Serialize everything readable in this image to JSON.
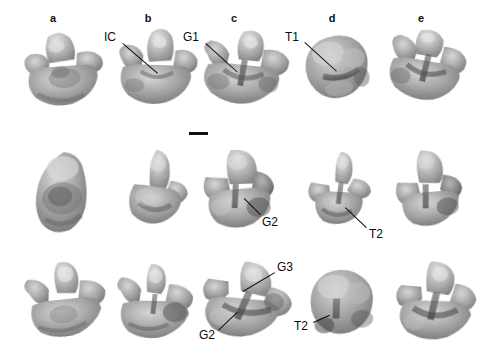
{
  "figure": {
    "background_color": "#ffffff",
    "ink_color": "#0d0d0d",
    "width": 485,
    "height": 357,
    "plate_kind": "photographic-plate",
    "specimen_count": 15,
    "row_count": 3,
    "column_count": 5
  },
  "column_headers": [
    {
      "label": "a",
      "x": 53,
      "y": 12
    },
    {
      "label": "b",
      "x": 148,
      "y": 12
    },
    {
      "label": "c",
      "x": 234,
      "y": 12
    },
    {
      "label": "d",
      "x": 332,
      "y": 12
    },
    {
      "label": "e",
      "x": 421,
      "y": 12
    }
  ],
  "scale_bar": {
    "name": "scale-bar",
    "x": 189,
    "y": 132,
    "width": 19,
    "height": 3,
    "color": "#101010"
  },
  "annotations": [
    {
      "id": "ic-row1-b",
      "text": "IC",
      "row": 1,
      "column": "b",
      "label_x": 104,
      "label_y": 31,
      "line_x1": 123,
      "line_y1": 43,
      "line_x2": 158,
      "line_y2": 73
    },
    {
      "id": "g1-row1-c",
      "text": "G1",
      "row": 1,
      "column": "c",
      "label_x": 183,
      "label_y": 31,
      "line_x1": 206,
      "line_y1": 43,
      "line_x2": 238,
      "line_y2": 72
    },
    {
      "id": "t1-row1-d",
      "text": "T1",
      "row": 1,
      "column": "d",
      "label_x": 285,
      "label_y": 31,
      "line_x1": 305,
      "line_y1": 42,
      "line_x2": 337,
      "line_y2": 71
    },
    {
      "id": "g2-row2-c",
      "text": "G2",
      "row": 2,
      "column": "c",
      "label_x": 262,
      "label_y": 216,
      "line_x1": 260,
      "line_y1": 215,
      "line_x2": 244,
      "line_y2": 199
    },
    {
      "id": "t2-row2-d",
      "text": "T2",
      "row": 2,
      "column": "d",
      "label_x": 369,
      "label_y": 228,
      "line_x1": 366,
      "line_y1": 228,
      "line_x2": 345,
      "line_y2": 208
    },
    {
      "id": "g3-row3-c",
      "text": "G3",
      "row": 3,
      "column": "c",
      "label_x": 277,
      "label_y": 261,
      "line_x1": 275,
      "line_y1": 273,
      "line_x2": 243,
      "line_y2": 292
    },
    {
      "id": "g2-row3-c",
      "text": "G2",
      "row": 3,
      "column": "c",
      "label_x": 199,
      "label_y": 329,
      "line_x1": 218,
      "line_y1": 330,
      "line_x2": 237,
      "line_y2": 312
    },
    {
      "id": "t2-row3-d",
      "text": "T2",
      "row": 3,
      "column": "d",
      "label_x": 294,
      "label_y": 320,
      "line_x1": 313,
      "line_y1": 322,
      "line_x2": 329,
      "line_y2": 315
    }
  ],
  "specimens": [
    {
      "id": "spec-a1",
      "row": 1,
      "column": "a",
      "x": 20,
      "y": 26,
      "w": 92,
      "h": 84,
      "shape": "cusped-crown-front",
      "rotate": -4
    },
    {
      "id": "spec-b1",
      "row": 1,
      "column": "b",
      "x": 113,
      "y": 24,
      "w": 88,
      "h": 86,
      "shape": "cusped-crown-front",
      "rotate": 2
    },
    {
      "id": "spec-c1",
      "row": 1,
      "column": "c",
      "x": 196,
      "y": 26,
      "w": 96,
      "h": 84,
      "shape": "cusped-crown-front",
      "rotate": 6
    },
    {
      "id": "spec-d1",
      "row": 1,
      "column": "d",
      "x": 300,
      "y": 30,
      "w": 78,
      "h": 74,
      "shape": "rounded-crown",
      "rotate": -8
    },
    {
      "id": "spec-e1",
      "row": 1,
      "column": "e",
      "x": 385,
      "y": 24,
      "w": 84,
      "h": 82,
      "shape": "cusped-crown-front",
      "rotate": 10
    },
    {
      "id": "spec-a2",
      "row": 2,
      "column": "a",
      "x": 30,
      "y": 148,
      "w": 74,
      "h": 90,
      "shape": "ovoid-lateral",
      "rotate": -3
    },
    {
      "id": "spec-b2",
      "row": 2,
      "column": "b",
      "x": 124,
      "y": 146,
      "w": 70,
      "h": 86,
      "shape": "ovoid-lateral",
      "rotate": 4
    },
    {
      "id": "spec-c2",
      "row": 2,
      "column": "c",
      "x": 198,
      "y": 146,
      "w": 80,
      "h": 86,
      "shape": "lobed-lateral",
      "rotate": -2
    },
    {
      "id": "spec-d2",
      "row": 2,
      "column": "d",
      "x": 305,
      "y": 148,
      "w": 72,
      "h": 82,
      "shape": "cusped-lateral",
      "rotate": 3
    },
    {
      "id": "spec-e2",
      "row": 2,
      "column": "e",
      "x": 392,
      "y": 146,
      "w": 74,
      "h": 84,
      "shape": "lobed-lateral",
      "rotate": -5
    },
    {
      "id": "spec-a3",
      "row": 3,
      "column": "a",
      "x": 22,
      "y": 258,
      "w": 90,
      "h": 84,
      "shape": "cusped-crown-front",
      "rotate": -6
    },
    {
      "id": "spec-b3",
      "row": 3,
      "column": "b",
      "x": 113,
      "y": 262,
      "w": 86,
      "h": 80,
      "shape": "cusped-crown-front",
      "rotate": 1
    },
    {
      "id": "spec-c3",
      "row": 3,
      "column": "c",
      "x": 196,
      "y": 258,
      "w": 100,
      "h": 84,
      "shape": "lobed-lateral",
      "rotate": 8
    },
    {
      "id": "spec-d3",
      "row": 3,
      "column": "d",
      "x": 303,
      "y": 266,
      "w": 80,
      "h": 76,
      "shape": "rounded-crown",
      "rotate": -4
    },
    {
      "id": "spec-e3",
      "row": 3,
      "column": "e",
      "x": 392,
      "y": 258,
      "w": 86,
      "h": 86,
      "shape": "cusped-crown-front",
      "rotate": 5
    }
  ],
  "tones": {
    "surface_mid": "#a9a5a0",
    "surface_light": "#d6d3ce",
    "surface_highlight": "#e8e6e2",
    "groove_dark": "#54524f",
    "shadow": "#6e6b67",
    "edge": "#8d8a86"
  }
}
